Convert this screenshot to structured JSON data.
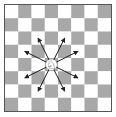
{
  "diagram": {
    "type": "chessboard",
    "board": {
      "size": 8,
      "top_left_color": "light",
      "light_color": "#ffffff",
      "dark_color": "#a8a8a8",
      "border_color": "#555555"
    },
    "piece": {
      "name": "knight",
      "color": "white",
      "col": 3,
      "row": 4,
      "glyph": "♘"
    },
    "moves": [
      {
        "col": 2,
        "row": 2
      },
      {
        "col": 4,
        "row": 2
      },
      {
        "col": 1,
        "row": 3
      },
      {
        "col": 5,
        "row": 3
      },
      {
        "col": 1,
        "row": 5
      },
      {
        "col": 5,
        "row": 5
      },
      {
        "col": 2,
        "row": 6
      },
      {
        "col": 4,
        "row": 6
      }
    ],
    "arrow_color": "#222222"
  }
}
